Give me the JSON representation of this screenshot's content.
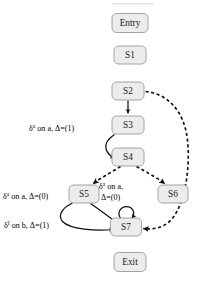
{
  "diagram": {
    "type": "state-machine-flow-graph",
    "nodes": [
      {
        "id": "entry",
        "label": "Entry",
        "x": 130,
        "y": 23,
        "w": 36,
        "h": 19
      },
      {
        "id": "s1",
        "label": "S1",
        "x": 130,
        "y": 55,
        "w": 32,
        "h": 18
      },
      {
        "id": "s2",
        "label": "S2",
        "x": 128,
        "y": 91,
        "w": 32,
        "h": 18
      },
      {
        "id": "s3",
        "label": "S3",
        "x": 128,
        "y": 125,
        "w": 32,
        "h": 18
      },
      {
        "id": "s4",
        "label": "S4",
        "x": 128,
        "y": 157,
        "w": 32,
        "h": 18
      },
      {
        "id": "s5",
        "label": "S5",
        "x": 84,
        "y": 194,
        "w": 30,
        "h": 18
      },
      {
        "id": "s6",
        "label": "S6",
        "x": 173,
        "y": 194,
        "w": 30,
        "h": 18
      },
      {
        "id": "s7",
        "label": "S7",
        "x": 126,
        "y": 227,
        "w": 31,
        "h": 18
      },
      {
        "id": "exit",
        "label": "Exit",
        "x": 130,
        "y": 262,
        "w": 32,
        "h": 19
      }
    ],
    "edge_labels": [
      {
        "id": "label-s3",
        "delta": "δ",
        "sup": "a",
        "text": " on a, Δ=(1)",
        "full": "δᵃ on a, Δ=(1)",
        "x": 29,
        "y": 128,
        "lines": [
          "δᵃ on a, Δ=(1)"
        ]
      },
      {
        "id": "label-s5",
        "delta": "δ",
        "sup": "a",
        "text": " on a, Δ=(0)",
        "full": "δᵃ on a, Δ=(0)",
        "x": 3,
        "y": 196,
        "lines": [
          "δᵃ on a, Δ=(0)"
        ]
      },
      {
        "id": "label-s7-loop",
        "delta": "δ",
        "sup": "a",
        "text": " on a,",
        "full": "δᵃ on a, Δ=(0)",
        "x": 99,
        "y": 186,
        "lines": [
          "δᵃ on a,",
          "Δ=(0)"
        ]
      },
      {
        "id": "label-s7-b",
        "delta": "δ",
        "sup": "f",
        "text": " on b, Δ=(1)",
        "full": "δᶠ on b, Δ=(1)",
        "x": 4,
        "y": 225,
        "lines": [
          "δᶠ on b, Δ=(1)"
        ]
      }
    ],
    "edges": [
      {
        "id": "e-s2-s3",
        "from": "s2",
        "to": "s3",
        "style": "solid",
        "arrow": true
      },
      {
        "id": "e-s3-s4",
        "from": "s3",
        "to": "s4",
        "style": "solid",
        "arrow": true
      },
      {
        "id": "e-s4-s5",
        "from": "s4",
        "to": "s5",
        "style": "dashed",
        "arrow": true
      },
      {
        "id": "e-s4-s6",
        "from": "s4",
        "to": "s6",
        "style": "dashed",
        "arrow": true
      },
      {
        "id": "e-s5-s7",
        "from": "s5",
        "to": "s7",
        "style": "solid",
        "arrow": true
      },
      {
        "id": "e-s5-s7b",
        "from": "s5",
        "to": "s7",
        "style": "solid",
        "arrow": true
      },
      {
        "id": "e-s7-s7",
        "from": "s7",
        "to": "s7",
        "style": "solid",
        "arrow": true
      },
      {
        "id": "e-s2-s7",
        "from": "s2",
        "to": "s7",
        "style": "dashed",
        "arrow": true
      }
    ],
    "colors": {
      "node_fill": "#ececec",
      "node_stroke": "#9a9a9a",
      "edge": "#111111",
      "background": "#ffffff"
    }
  }
}
